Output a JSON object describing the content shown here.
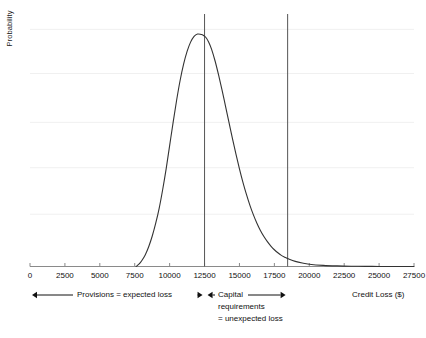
{
  "chart_data": {
    "type": "line",
    "title": "",
    "subtitle": "",
    "xlabel": "Credit Loss ($)",
    "ylabel": "Probability",
    "xlim": [
      0,
      27500
    ],
    "ylim": [
      0,
      1
    ],
    "grid": "horizontal",
    "legend_position": "none",
    "xticks": [
      0,
      2500,
      5000,
      7500,
      10000,
      12500,
      15000,
      17500,
      20000,
      22500,
      25000,
      27500
    ],
    "xtick_labels": [
      "0",
      "2500",
      "5000",
      "7500",
      "10000",
      "12500",
      "15000",
      "17500",
      "20000",
      "22500",
      "25000",
      "27500"
    ],
    "yticks": [],
    "ytick_labels": [],
    "series": [
      {
        "name": "Credit loss distribution",
        "color": "#333333",
        "x": [
          7600,
          7800,
          8000,
          8250,
          8500,
          8750,
          9000,
          9250,
          9500,
          9750,
          10000,
          10250,
          10500,
          10750,
          11000,
          11250,
          11500,
          11750,
          12000,
          12250,
          12400,
          12600,
          12800,
          13000,
          13250,
          13500,
          13750,
          14000,
          14250,
          14500,
          14750,
          15000,
          15250,
          15500,
          15750,
          16000,
          16250,
          16500,
          16750,
          17000,
          17250,
          17500,
          17750,
          18000,
          18250,
          18500,
          19000,
          19500,
          20000,
          21000,
          22000,
          23000,
          24000,
          25000,
          26000,
          27500
        ],
        "y": [
          0.0,
          0.01,
          0.025,
          0.05,
          0.085,
          0.13,
          0.185,
          0.25,
          0.33,
          0.42,
          0.52,
          0.62,
          0.715,
          0.8,
          0.87,
          0.925,
          0.965,
          0.99,
          1.0,
          0.998,
          0.995,
          0.985,
          0.965,
          0.935,
          0.885,
          0.825,
          0.76,
          0.69,
          0.62,
          0.55,
          0.483,
          0.42,
          0.362,
          0.31,
          0.263,
          0.222,
          0.186,
          0.155,
          0.129,
          0.107,
          0.088,
          0.072,
          0.059,
          0.048,
          0.04,
          0.033,
          0.022,
          0.015,
          0.01,
          0.005,
          0.0025,
          0.0012,
          0.0006,
          0.0003,
          0.0001,
          0.0
        ]
      }
    ],
    "vlines": [
      {
        "name": "expected-loss-line",
        "x": 12500,
        "color": "#555555"
      },
      {
        "name": "capital-requirement-line",
        "x": 18450,
        "color": "#555555"
      }
    ],
    "gridline_y_values": [
      1.02,
      0.83,
      0.62,
      0.425,
      0.225
    ]
  },
  "annotations": {
    "provisions": {
      "label": "Provisions = expected loss",
      "from_x": 0,
      "to_x": 12500
    },
    "capital": {
      "line1": "Capital",
      "line2": "requirements",
      "line3": "= unexpected loss",
      "from_x": 12500,
      "to_x": 18450
    }
  },
  "axis": {
    "x_title": "Credit Loss ($)",
    "y_title": "Probability"
  },
  "colors": {
    "curve": "#333333",
    "axis": "#888888",
    "grid": "#f0f0f0",
    "vline": "#555555",
    "text": "#111111"
  }
}
